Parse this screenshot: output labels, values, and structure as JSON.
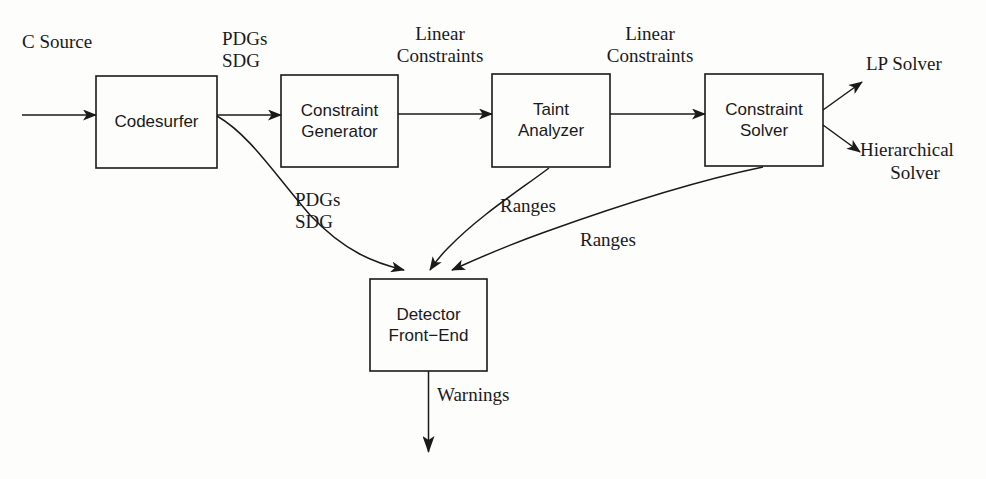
{
  "figure": {
    "title_cut_off": "DETECTOR ARCHITECTURE",
    "background_color": "#fdfdfc",
    "stroke_color": "#1a1a1a"
  },
  "boxes": [
    {
      "id": "codesurfer",
      "label_line1": "Codesurfer",
      "label_line2": "",
      "x": 96,
      "y": 76,
      "w": 121,
      "h": 92
    },
    {
      "id": "constraint-generator",
      "label_line1": "Constraint",
      "label_line2": "Generator",
      "x": 281,
      "y": 75,
      "w": 117,
      "h": 92
    },
    {
      "id": "taint-analyzer",
      "label_line1": "Taint",
      "label_line2": "Analyzer",
      "x": 492,
      "y": 74,
      "w": 118,
      "h": 93
    },
    {
      "id": "constraint-solver",
      "label_line1": "Constraint",
      "label_line2": "Solver",
      "x": 705,
      "y": 74,
      "w": 118,
      "h": 92
    },
    {
      "id": "detector-front-end",
      "label_line1": "Detector",
      "label_line2": "Front−End",
      "x": 370,
      "y": 279,
      "w": 117,
      "h": 92
    }
  ],
  "labels": {
    "c_source": "C Source",
    "pdgs_top": "PDGs",
    "sdg_top": "SDG",
    "linear_1_line1": "Linear",
    "linear_1_line2": "Constraints",
    "linear_2_line1": "Linear",
    "linear_2_line2": "Constraints",
    "lp_solver": "LP Solver",
    "hierarchical_line1": "Hierarchical",
    "hierarchical_line2": "Solver",
    "pdgs_low": "PDGs",
    "sdg_low": "SDG",
    "ranges_1": "Ranges",
    "ranges_2": "Ranges",
    "warnings": "Warnings"
  },
  "edges": [
    {
      "id": "input-to-codesurfer",
      "label": "C Source"
    },
    {
      "id": "codesurfer-to-constraint-generator",
      "label": "PDGs / SDG"
    },
    {
      "id": "constraint-generator-to-taint-analyzer",
      "label": "Linear Constraints"
    },
    {
      "id": "taint-analyzer-to-constraint-solver",
      "label": "Linear Constraints"
    },
    {
      "id": "constraint-solver-to-lp-solver",
      "label": "LP Solver"
    },
    {
      "id": "constraint-solver-to-hierarchical-solver",
      "label": "Hierarchical Solver"
    },
    {
      "id": "codesurfer-to-detector",
      "label": "PDGs / SDG"
    },
    {
      "id": "taint-analyzer-to-detector",
      "label": "Ranges"
    },
    {
      "id": "constraint-solver-to-detector",
      "label": "Ranges"
    },
    {
      "id": "detector-to-output",
      "label": "Warnings"
    }
  ]
}
